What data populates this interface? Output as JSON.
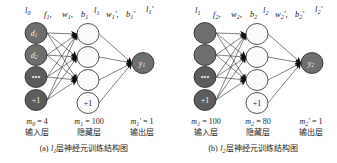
{
  "figure": {
    "panels": [
      {
        "id": "a",
        "caption_prefix": "(a)",
        "caption_symbol": "l",
        "caption_symbol_sub": "1",
        "caption_text": "层神经元训练结构图",
        "top_labels": [
          {
            "name": "input-layer-symbol",
            "base": "l",
            "sub": "0",
            "prime": "",
            "trailing": ""
          },
          {
            "name": "activation-symbol",
            "base": "f",
            "sub": "1",
            "prime": "",
            "trailing": ","
          },
          {
            "name": "weight-symbol",
            "base": "w",
            "sub": "1",
            "prime": "",
            "trailing": ","
          },
          {
            "name": "bias-symbol",
            "base": "b",
            "sub": "1",
            "prime": "",
            "trailing": ""
          },
          {
            "name": "hidden-layer-symbol",
            "base": "l",
            "sub": "1",
            "prime": "",
            "trailing": ""
          },
          {
            "name": "weight-prime-symbol",
            "base": "w",
            "sub": "1",
            "prime": "′",
            "trailing": ","
          },
          {
            "name": "bias-prime-symbol",
            "base": "b",
            "sub": "1",
            "prime": "′",
            "trailing": ""
          },
          {
            "name": "output-layer-symbol",
            "base": "l",
            "sub": "1",
            "prime": "′",
            "trailing": ""
          }
        ],
        "input_nodes": [
          {
            "label": "d",
            "sub": "1",
            "style": "dark"
          },
          {
            "label": "d",
            "sub": "2",
            "style": "dark"
          },
          {
            "label": "•••",
            "sub": "",
            "style": "dark"
          },
          {
            "label": "+1",
            "sub": "",
            "style": "dark"
          }
        ],
        "hidden_nodes": [
          {
            "label": "",
            "sub": "",
            "style": "light"
          },
          {
            "label": "",
            "sub": "",
            "style": "light"
          },
          {
            "label": "",
            "sub": "",
            "style": "light"
          },
          {
            "label": "+1",
            "sub": "",
            "style": "light"
          }
        ],
        "output_nodes": [
          {
            "label": "y",
            "sub": "1",
            "style": "dark"
          }
        ],
        "layer_annotations": [
          {
            "name": "input-count",
            "sym": "m",
            "sub": "0",
            "prime": "",
            "eq": "= 4",
            "cn": "输入层"
          },
          {
            "name": "hidden-count",
            "sym": "m",
            "sub": "1",
            "prime": "",
            "eq": "= 100",
            "cn": "隐藏层"
          },
          {
            "name": "output-count",
            "sym": "m",
            "sub": "1",
            "prime": "′",
            "eq": "= 1",
            "cn": "输出层"
          }
        ]
      },
      {
        "id": "b",
        "caption_prefix": "(b)",
        "caption_symbol": "l",
        "caption_symbol_sub": "2",
        "caption_text": "层神经元训练结构图",
        "top_labels": [
          {
            "name": "input-layer-symbol",
            "base": "l",
            "sub": "1",
            "prime": "",
            "trailing": ""
          },
          {
            "name": "activation-symbol",
            "base": "f",
            "sub": "2",
            "prime": "",
            "trailing": ","
          },
          {
            "name": "weight-symbol",
            "base": "w",
            "sub": "2",
            "prime": "",
            "trailing": ","
          },
          {
            "name": "bias-symbol",
            "base": "b",
            "sub": "2",
            "prime": "",
            "trailing": ""
          },
          {
            "name": "hidden-layer-symbol",
            "base": "l",
            "sub": "2",
            "prime": "",
            "trailing": ""
          },
          {
            "name": "weight-prime-symbol",
            "base": "w",
            "sub": "2",
            "prime": "′",
            "trailing": ","
          },
          {
            "name": "bias-prime-symbol",
            "base": "b",
            "sub": "2",
            "prime": "′",
            "trailing": ""
          },
          {
            "name": "output-layer-symbol",
            "base": "l",
            "sub": "2",
            "prime": "′",
            "trailing": ""
          }
        ],
        "input_nodes": [
          {
            "label": "",
            "sub": "",
            "style": "dark"
          },
          {
            "label": "",
            "sub": "",
            "style": "dark"
          },
          {
            "label": "•••",
            "sub": "",
            "style": "dark"
          },
          {
            "label": "+1",
            "sub": "",
            "style": "dark"
          }
        ],
        "hidden_nodes": [
          {
            "label": "",
            "sub": "",
            "style": "light"
          },
          {
            "label": "",
            "sub": "",
            "style": "light"
          },
          {
            "label": "",
            "sub": "",
            "style": "light"
          },
          {
            "label": "+1",
            "sub": "",
            "style": "light"
          }
        ],
        "output_nodes": [
          {
            "label": "y",
            "sub": "2",
            "style": "dark"
          }
        ],
        "layer_annotations": [
          {
            "name": "input-count",
            "sym": "m",
            "sub": "1",
            "prime": "",
            "eq": "= 100",
            "cn": "输入层"
          },
          {
            "name": "hidden-count",
            "sym": "m",
            "sub": "2",
            "prime": "",
            "eq": "= 80",
            "cn": "隐藏层"
          },
          {
            "name": "output-count",
            "sym": "m",
            "sub": "2",
            "prime": "′",
            "eq": "= 1",
            "cn": "输出层"
          }
        ]
      }
    ],
    "colors": {
      "node_dark_fill": "#6e6e6e",
      "node_light_fill": "#fbfbfb",
      "node_stroke": "#2a2a2a",
      "edge": "#2b2b2b",
      "arrow": "#101010",
      "background": "#ffffff",
      "text": "#1b1b1b"
    },
    "geometry": {
      "input_x": 36,
      "hidden_x": 88,
      "output_x": 143,
      "node_rx": 11,
      "node_ry": 10.5,
      "input_ys": [
        33,
        55,
        77,
        100
      ],
      "hidden_ys": [
        34,
        57,
        80,
        103
      ],
      "output_y": 63
    }
  }
}
